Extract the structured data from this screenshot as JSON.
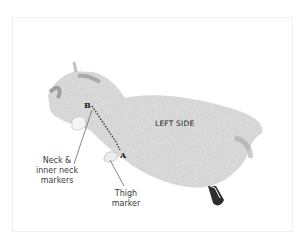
{
  "illustration": {
    "subject": "knitted piece laid flat with markers",
    "side_label": "LEFT SIDE",
    "points": {
      "a": "A",
      "b": "B"
    },
    "callouts": {
      "neck": {
        "line1": "Neck &",
        "line2": "inner neck",
        "line3": "markers"
      },
      "thigh": {
        "line1": "Thigh",
        "line2": "marker"
      }
    }
  },
  "colors": {
    "background": "#ffffff",
    "frame": "#f0f0f0",
    "text": "#3a3a3a",
    "knit": "#d8d8d8",
    "knit_dark": "#8a8a8a"
  }
}
